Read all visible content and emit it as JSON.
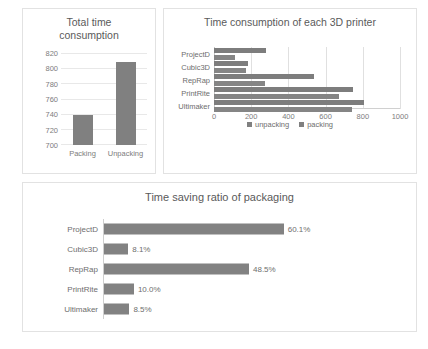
{
  "chart_data": [
    {
      "type": "bar",
      "id": "total-time-consumption",
      "title": "Total time consumption",
      "title_line1": "Total time",
      "title_line2": "consumption",
      "categories": [
        "Packing",
        "Unpacking"
      ],
      "values": [
        740,
        809
      ],
      "xlabel": "",
      "ylabel": "",
      "ylim": [
        700,
        820
      ],
      "yticks": [
        700,
        720,
        740,
        760,
        780,
        800,
        820
      ],
      "grid": true,
      "legend": "none",
      "bar_color": "#808080"
    },
    {
      "type": "bar",
      "id": "time-consumption-each-printer",
      "orientation": "horizontal",
      "title": "Time consumption of each 3D printer",
      "categories": [
        "ProjectD",
        "Cubic3D",
        "RepRap",
        "PrintRite",
        "Ultimaker"
      ],
      "series": [
        {
          "name": "unpacking",
          "values": [
            280,
            185,
            535,
            745,
            808
          ]
        },
        {
          "name": "packing",
          "values": [
            112,
            170,
            275,
            670,
            740
          ]
        }
      ],
      "xlabel": "",
      "ylabel": "",
      "xlim": [
        0,
        1000
      ],
      "xticks": [
        0,
        200,
        400,
        600,
        800,
        1000
      ],
      "grid": true,
      "legend": "bottom",
      "legend_entries": [
        "unpacking",
        "packing"
      ],
      "bar_color": "#808080"
    },
    {
      "type": "bar",
      "id": "time-saving-ratio",
      "orientation": "horizontal",
      "title": "Time saving ratio of packaging",
      "categories": [
        "ProjectD",
        "Cubic3D",
        "RepRap",
        "PrintRite",
        "Ultimaker"
      ],
      "values": [
        60.1,
        8.1,
        48.5,
        10.0,
        8.5
      ],
      "data_labels": [
        "60.1%",
        "8.1%",
        "48.5%",
        "10.0%",
        "8.5%"
      ],
      "xlabel": "",
      "ylabel": "",
      "xlim": [
        0,
        100
      ],
      "grid": false,
      "legend": "none",
      "bar_color": "#828282"
    }
  ]
}
